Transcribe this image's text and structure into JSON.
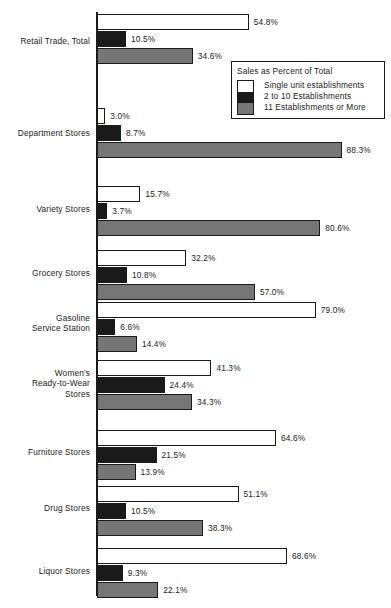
{
  "chart_data": {
    "type": "bar",
    "title": "",
    "xlabel": "",
    "ylabel": "",
    "orientation": "horizontal",
    "grid": false,
    "xlim": [
      0,
      100
    ],
    "legend_position": "top-right",
    "legend_title": "Sales as Percent of Total",
    "value_suffix": "%",
    "categories": [
      "Retail Trade, Total",
      "Department Stores",
      "Variety Stores",
      "Grocery Stores",
      "Gasoline\nService Station",
      "Women's\nReady-to-Wear\nStores",
      "Furniture Stores",
      "Drug Stores",
      "Liquor Stores"
    ],
    "series": [
      {
        "name": "Single unit establishments",
        "color": "#ffffff",
        "values": [
          54.8,
          3.0,
          15.7,
          32.2,
          79.0,
          41.3,
          64.6,
          51.1,
          68.6
        ],
        "labels": [
          "54.8%",
          "3.0%",
          "15.7%",
          "32.2%",
          "79.0%",
          "41.3%",
          "64.6%",
          "51.1%",
          "68.6%"
        ]
      },
      {
        "name": "2 to 10 Establishments",
        "color": "#1a1a1a",
        "values": [
          10.5,
          8.7,
          3.7,
          10.8,
          6.6,
          24.4,
          21.5,
          10.5,
          9.3
        ],
        "labels": [
          "10.5%",
          "8.7%",
          "3.7%",
          "10.8%",
          "6.6%",
          "24.4%",
          "21.5%",
          "10.5%",
          "9.3%"
        ]
      },
      {
        "name": "11 Establishments or More",
        "color": "#767676",
        "values": [
          34.6,
          88.3,
          80.6,
          57.0,
          14.4,
          34.3,
          13.9,
          38.3,
          22.1
        ],
        "labels": [
          "34.6%",
          "88.3%",
          "80.6%",
          "57.0%",
          "14.4%",
          "34.3%",
          "13.9%",
          "38.3%",
          "22.1%"
        ]
      }
    ]
  },
  "legend": {
    "title": "Sales as Percent of Total",
    "items": [
      {
        "label": "Single unit establishments",
        "swatch": "white"
      },
      {
        "label": "2 to 10 Establishments",
        "swatch": "black"
      },
      {
        "label": "11 Establishments or More",
        "swatch": "gray"
      }
    ]
  },
  "layout": {
    "axis_x": 97,
    "px_per_percent": 2.77,
    "group_tops": [
      14,
      108,
      186,
      250,
      302,
      360,
      430,
      486,
      548
    ],
    "label_tops": [
      36,
      128,
      204,
      268,
      313,
      368,
      447,
      503,
      566
    ]
  }
}
